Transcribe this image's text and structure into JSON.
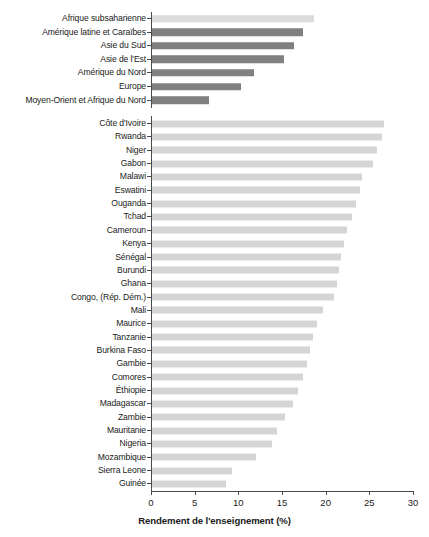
{
  "chart_data": {
    "type": "bar",
    "orientation": "horizontal",
    "title": "",
    "xlabel": "Rendement de l'enseignement (%)",
    "ylabel": "",
    "xlim": [
      0,
      30
    ],
    "xticks": [
      0,
      5,
      10,
      15,
      20,
      25,
      30
    ],
    "grid": false,
    "legend": false,
    "colors": {
      "region_bar": "#808080",
      "region_highlight_bar": "#dcdcdc",
      "country_bar": "#d5d5d5",
      "axis": "#4a4a4a",
      "text": "#1a1a1a"
    },
    "groups": [
      {
        "name": "regions",
        "categories": [
          "Afrique subsaharienne",
          "Amérique latine et Caraïbes",
          "Asie du Sud",
          "Asie de l'Est",
          "Amérique du Nord",
          "Europe",
          "Moyen-Orient et Afrique du Nord"
        ],
        "values": [
          18.7,
          17.4,
          16.4,
          15.2,
          11.8,
          10.3,
          6.6
        ],
        "highlight_index": 0
      },
      {
        "name": "countries",
        "categories": [
          "Côte d'Ivoire",
          "Rwanda",
          "Niger",
          "Gabon",
          "Malawi",
          "Eswatini",
          "Ouganda",
          "Tchad",
          "Cameroun",
          "Kenya",
          "Sénégal",
          "Burundi",
          "Ghana",
          "Congo, (Rép. Dém.)",
          "Mali",
          "Maurice",
          "Tanzanie",
          "Burkina Faso",
          "Gambie",
          "Comores",
          "Éthiopie",
          "Madagascar",
          "Zambie",
          "Mauritanie",
          "Nigeria",
          "Mozambique",
          "Sierra Leone",
          "Guinée"
        ],
        "values": [
          26.7,
          26.4,
          25.9,
          25.4,
          24.2,
          23.9,
          23.5,
          23.0,
          22.4,
          22.1,
          21.8,
          21.5,
          21.3,
          21.0,
          19.7,
          19.0,
          18.6,
          18.2,
          17.9,
          17.4,
          16.8,
          16.3,
          15.3,
          14.4,
          13.9,
          12.0,
          9.3,
          8.6
        ]
      }
    ]
  }
}
